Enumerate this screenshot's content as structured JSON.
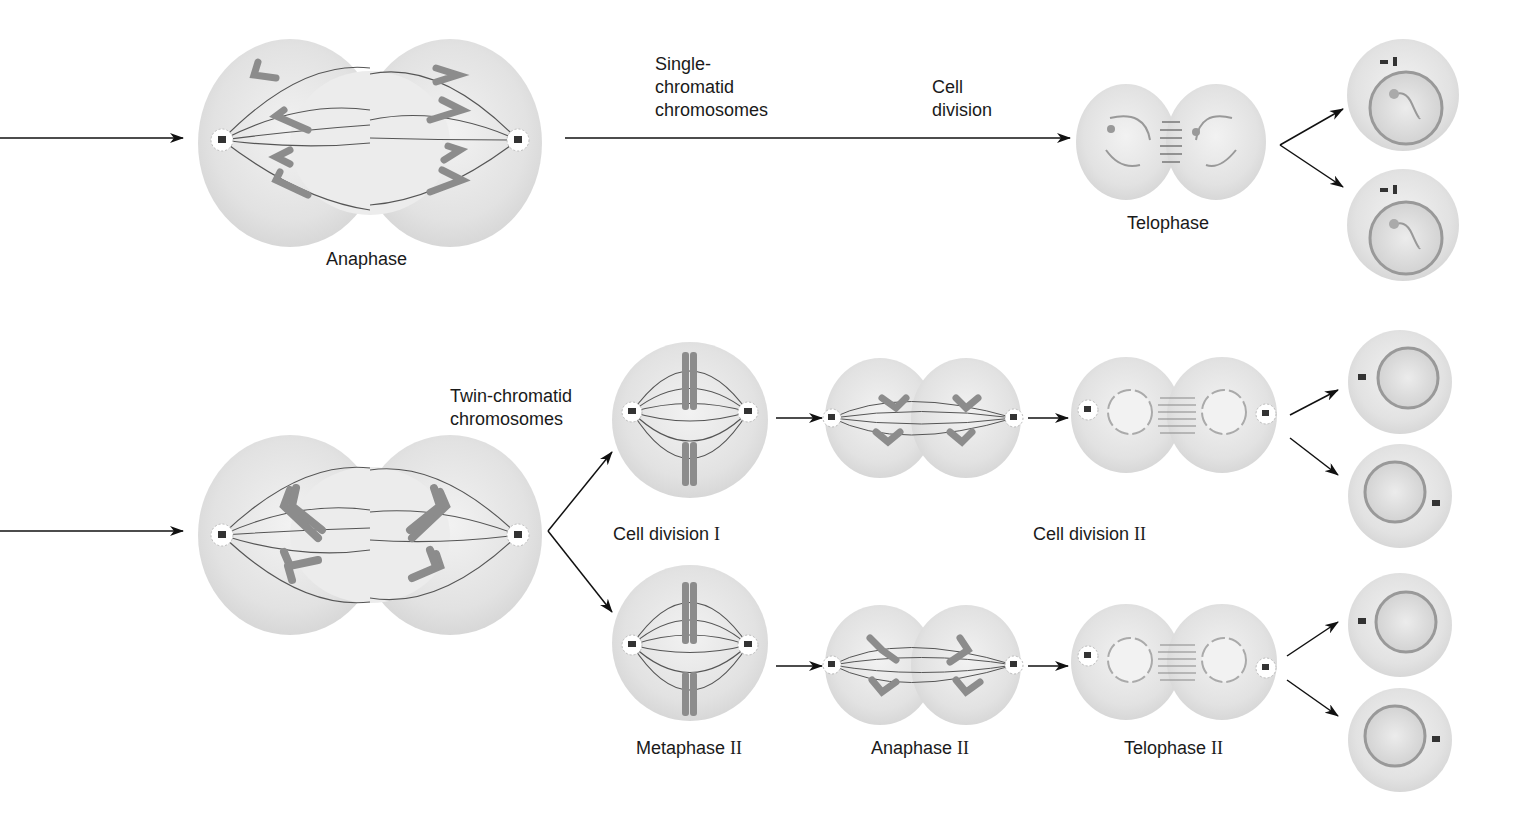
{
  "mitosis": {
    "anaphase_label": "Anaphase",
    "single_chromatid_label": [
      "Single-",
      "chromatid",
      "chromosomes"
    ],
    "cell_division_label": [
      "Cell",
      "division"
    ],
    "telophase_label": "Telophase"
  },
  "meiosis": {
    "twin_chromatid_label": [
      "Twin-chromatid",
      "chromosomes"
    ],
    "cell_division_1_label": "Cell division",
    "cell_division_1_numeral": "I",
    "cell_division_2_label": "Cell division",
    "cell_division_2_numeral": "II",
    "metaphase_2_label": "Metaphase",
    "metaphase_2_numeral": "II",
    "anaphase_2_label": "Anaphase",
    "anaphase_2_numeral": "II",
    "telophase_2_label": "Telophase",
    "telophase_2_numeral": "II"
  },
  "colors": {
    "cell_fill": "#e4e4e4",
    "cell_edge": "#c9c9c9",
    "chromosome": "#8c8c8c",
    "spindle": "#555555",
    "arrow": "#111111"
  }
}
